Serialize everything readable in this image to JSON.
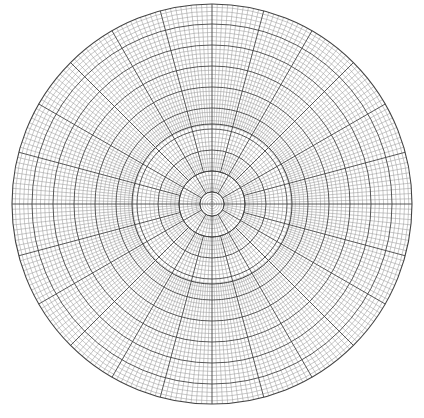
{
  "diagram": {
    "type": "polar-graph-paper",
    "canvas": {
      "width": 424,
      "height": 418,
      "background": "#ffffff"
    },
    "center": {
      "x": 212,
      "y": 204
    },
    "outer_radius": 200,
    "inner_disk": {
      "radius": 12,
      "ring_count": 5,
      "has_crosshair": true
    },
    "zones": [
      {
        "r_from": 12,
        "r_to": 33,
        "radial_step_deg": 6
      },
      {
        "r_from": 33,
        "r_to": 80,
        "radial_step_deg": 3
      },
      {
        "r_from": 80,
        "r_to": 200,
        "radial_step_deg": 1.5
      }
    ],
    "ring_spacing_px": 4.2,
    "major_ring_every": 5,
    "major_radial_every_deg": 15,
    "colors": {
      "minor_line": "#9a9a9a",
      "major_line": "#444444",
      "center_rings": "#aaaaaa"
    }
  }
}
